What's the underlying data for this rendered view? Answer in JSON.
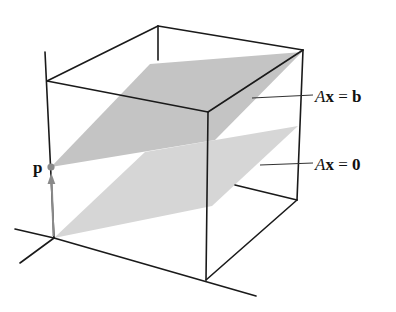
{
  "diagram": {
    "planes": [
      {
        "id": "affine-plane",
        "label_prefix": "A",
        "label_var": "x",
        "label_op": " = ",
        "label_rhs": "b",
        "color": "#c7c7c7"
      },
      {
        "id": "null-plane",
        "label_prefix": "A",
        "label_var": "x",
        "label_op": " = ",
        "label_rhs": "0",
        "color": "#d6d6d6"
      }
    ],
    "point": {
      "label": "p",
      "color": "#8a8a8a"
    },
    "arrow_color": "#8a8a8a",
    "edge_color": "#1a1a1a"
  }
}
